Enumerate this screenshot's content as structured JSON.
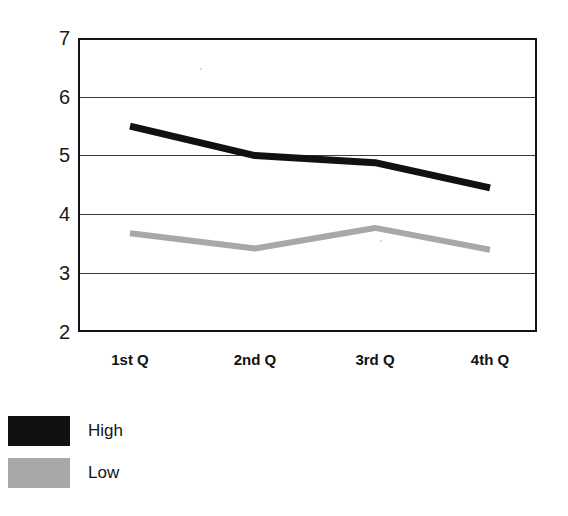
{
  "chart_data": {
    "type": "line",
    "title": "",
    "subtitle": "",
    "xlabel": "",
    "ylabel": "",
    "categories": [
      "1st Q",
      "2nd Q",
      "3rd Q",
      "4th Q"
    ],
    "ylim": [
      2,
      7
    ],
    "yticks": [
      2,
      3,
      4,
      5,
      6,
      7
    ],
    "ytick_labels": [
      "2",
      "3",
      "4",
      "5",
      "6",
      "7"
    ],
    "grid": true,
    "grid_axis": "y",
    "legend_position": "bottom-left",
    "series": [
      {
        "name": "High",
        "color": "#111111",
        "values": [
          5.5,
          5.0,
          4.88,
          4.45
        ]
      },
      {
        "name": "Low",
        "color": "#a8a8a8",
        "values": [
          3.68,
          3.42,
          3.77,
          3.4
        ]
      }
    ]
  },
  "axes": {
    "y_ticks": [
      {
        "label": "7",
        "value": 7
      },
      {
        "label": "6",
        "value": 6
      },
      {
        "label": "5",
        "value": 5
      },
      {
        "label": "4",
        "value": 4
      },
      {
        "label": "3",
        "value": 3
      },
      {
        "label": "2",
        "value": 2
      }
    ],
    "x_ticks": [
      {
        "label": "1st Q"
      },
      {
        "label": "2nd Q"
      },
      {
        "label": "3rd Q"
      },
      {
        "label": "4th Q"
      }
    ]
  },
  "legend": {
    "items": [
      {
        "label": "High",
        "color": "#111111"
      },
      {
        "label": "Low",
        "color": "#a8a8a8"
      }
    ]
  },
  "colors": {
    "high": "#111111",
    "low": "#a8a8a8",
    "axis": "#141414",
    "grid": "#3a3a3a",
    "background": "#ffffff"
  }
}
